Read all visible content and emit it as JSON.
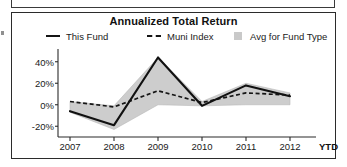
{
  "card": {
    "title": "Annualized Total Return"
  },
  "legend": {
    "items": [
      {
        "label": "This Fund",
        "marker": "solid-line-swatch",
        "color": "#151515"
      },
      {
        "label": "Muni Index",
        "marker": "dashed-line-swatch",
        "color": "#151515"
      },
      {
        "label": "Avg for Fund Type",
        "marker": "filled-square-swatch",
        "color": "#c9c9c9"
      }
    ]
  },
  "axis": {
    "y_ticks": [
      "40%",
      "20%",
      "0%",
      "-20%"
    ],
    "x_ticks": [
      "2007",
      "2008",
      "2009",
      "2010",
      "2011",
      "2012"
    ],
    "x_suffix": "YTD"
  },
  "chart_data": {
    "type": "line",
    "title": "Annualized Total Return",
    "xlabel": "",
    "ylabel": "",
    "categories": [
      "2007",
      "2008",
      "2009",
      "2010",
      "2011",
      "2012"
    ],
    "ylim": [
      -30,
      50
    ],
    "ytick_values": [
      40,
      20,
      0,
      -20
    ],
    "grid": false,
    "legend_position": "top",
    "series": [
      {
        "name": "This Fund",
        "style": "solid",
        "color": "#151515",
        "values": [
          -6,
          -19,
          44,
          -1,
          18,
          8
        ]
      },
      {
        "name": "Muni Index",
        "style": "dashed",
        "color": "#151515",
        "values": [
          3,
          -2,
          13,
          2,
          11,
          9
        ]
      },
      {
        "name": "Avg for Fund Type",
        "style": "band",
        "color": "#c9c9c9",
        "band_upper": [
          3,
          -1,
          44,
          3,
          20,
          11
        ],
        "band_lower": [
          -7,
          -23,
          0,
          -1,
          0,
          0
        ]
      }
    ]
  }
}
